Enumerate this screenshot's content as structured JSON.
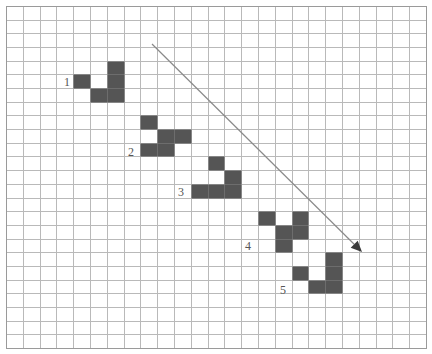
{
  "diagram": {
    "type": "grid-pattern-sequence",
    "grid": {
      "columns": 25,
      "rows": 25,
      "origin_x": 6,
      "origin_y": 6,
      "cell_width": 16.8,
      "cell_height": 13.68,
      "line_color": "#b9b9b9",
      "fill_color": "#555555"
    },
    "shapes": [
      {
        "label": "1",
        "label_pos": [
          64,
          86
        ],
        "cells": [
          [
            4,
            5
          ],
          [
            6,
            4
          ],
          [
            6,
            5
          ],
          [
            5,
            6
          ],
          [
            6,
            6
          ]
        ]
      },
      {
        "label": "2",
        "label_pos": [
          128,
          156
        ],
        "cells": [
          [
            8,
            8
          ],
          [
            9,
            9
          ],
          [
            10,
            9
          ],
          [
            8,
            10
          ],
          [
            9,
            10
          ]
        ]
      },
      {
        "label": "3",
        "label_pos": [
          178,
          196
        ],
        "cells": [
          [
            12,
            11
          ],
          [
            13,
            12
          ],
          [
            11,
            13
          ],
          [
            12,
            13
          ],
          [
            13,
            13
          ]
        ]
      },
      {
        "label": "4",
        "label_pos": [
          245,
          250
        ],
        "cells": [
          [
            15,
            15
          ],
          [
            17,
            15
          ],
          [
            16,
            16
          ],
          [
            17,
            16
          ],
          [
            16,
            17
          ]
        ]
      },
      {
        "label": "5",
        "label_pos": [
          280,
          294
        ],
        "cells": [
          [
            19,
            18
          ],
          [
            17,
            19
          ],
          [
            19,
            19
          ],
          [
            18,
            20
          ],
          [
            19,
            20
          ]
        ]
      }
    ],
    "arrow": {
      "from": [
        152,
        44
      ],
      "to": [
        362,
        252
      ],
      "color": "#8a8a8a"
    }
  }
}
